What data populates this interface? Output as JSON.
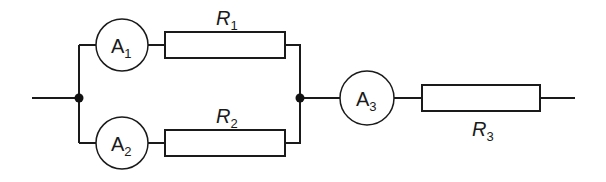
{
  "diagram": {
    "type": "circuit",
    "ammeters": [
      {
        "id": "A1",
        "letter": "A",
        "sub": "1"
      },
      {
        "id": "A2",
        "letter": "A",
        "sub": "2"
      },
      {
        "id": "A3",
        "letter": "A",
        "sub": "3"
      }
    ],
    "resistors": [
      {
        "id": "R1",
        "letter": "R",
        "sub": "1"
      },
      {
        "id": "R2",
        "letter": "R",
        "sub": "2"
      },
      {
        "id": "R3",
        "letter": "R",
        "sub": "3"
      }
    ],
    "topology": "A1+R1 in parallel with A2+R2, then in series with A3 and R3",
    "colors": {
      "line": "#1a1a1a",
      "background": "#ffffff"
    }
  }
}
